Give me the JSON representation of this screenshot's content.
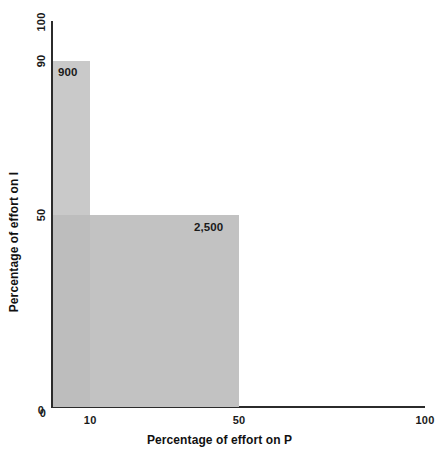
{
  "chart_data": {
    "type": "area",
    "title": "",
    "subtitle": "",
    "xlabel": "Percentage of effort on P",
    "ylabel": "Percentage of effort on I",
    "xlim": [
      0,
      100
    ],
    "ylim": [
      0,
      100
    ],
    "xticks": [
      "0",
      "10",
      "50",
      "100"
    ],
    "xtick_values": [
      0,
      10,
      50,
      100
    ],
    "yticks": [
      "0",
      "50",
      "90",
      "100"
    ],
    "ytick_values": [
      0,
      50,
      90,
      100
    ],
    "grid": false,
    "legend": "none",
    "series": [
      {
        "name": "900",
        "label": "900",
        "x_start": 0,
        "x_end": 10,
        "y_start": 0,
        "y_end": 90,
        "value": 900,
        "color": "#c9c9c9"
      },
      {
        "name": "2,500",
        "label": "2,500",
        "x_start": 0,
        "x_end": 50,
        "y_start": 0,
        "y_end": 50,
        "value": 2500,
        "color": "#c2c2c2"
      }
    ],
    "annotations": [
      {
        "text": "900",
        "x": 10,
        "y": 90
      },
      {
        "text": "2,500",
        "x": 50,
        "y": 50
      }
    ]
  },
  "axes": {
    "x": {
      "title": "Percentage of effort on P",
      "ticks": [
        {
          "label": "0",
          "value": 0
        },
        {
          "label": "10",
          "value": 10
        },
        {
          "label": "50",
          "value": 50
        },
        {
          "label": "100",
          "value": 100
        }
      ]
    },
    "y": {
      "title": "Percentage of effort on I",
      "ticks": [
        {
          "label": "0",
          "value": 0
        },
        {
          "label": "50",
          "value": 50
        },
        {
          "label": "90",
          "value": 90
        },
        {
          "label": "100",
          "value": 100
        }
      ]
    }
  },
  "ghost": {
    "text": ""
  },
  "colors": {
    "bar_tall": "#c9c9c9",
    "bar_wide": "#c2c2c2",
    "bar_overlap": "#bdbdbd",
    "axis": "#2b2b2b",
    "text": "#1a1a1a",
    "background": "#ffffff"
  }
}
